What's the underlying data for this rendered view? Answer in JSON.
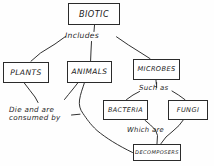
{
  "diagram": {
    "style": "hand-drawn pencil sketch on white paper",
    "ink_color": "#1f1f1f",
    "paper_color": "#fefefe",
    "nodes": [
      {
        "id": "biotic",
        "label": "BIOTIC"
      },
      {
        "id": "plants",
        "label": "PLANTS"
      },
      {
        "id": "animals",
        "label": "ANIMALS"
      },
      {
        "id": "microbes",
        "label": "MICROBES"
      },
      {
        "id": "bacteria",
        "label": "BACTERIA"
      },
      {
        "id": "fungi",
        "label": "FUNGI"
      },
      {
        "id": "decomposers",
        "label": "DECOMPOSERS"
      }
    ],
    "edge_labels": [
      {
        "id": "includes",
        "text": "Includes"
      },
      {
        "id": "such-as",
        "text": "Such as"
      },
      {
        "id": "which-are",
        "text": "Which are"
      },
      {
        "id": "die-consumed",
        "text": "Die and are\nconsumed by"
      }
    ],
    "edges": [
      {
        "from": "biotic",
        "to": "plants",
        "label": "Includes"
      },
      {
        "from": "biotic",
        "to": "animals",
        "label": "Includes"
      },
      {
        "from": "biotic",
        "to": "microbes",
        "label": "Includes"
      },
      {
        "from": "microbes",
        "to": "bacteria",
        "label": "Such as"
      },
      {
        "from": "microbes",
        "to": "fungi",
        "label": "Such as"
      },
      {
        "from": "bacteria",
        "to": "decomposers",
        "label": "Which are"
      },
      {
        "from": "fungi",
        "to": "decomposers",
        "label": "Which are"
      },
      {
        "from": "plants",
        "to": "decomposers",
        "label": "Die and are consumed by"
      },
      {
        "from": "animals",
        "to": "decomposers",
        "label": "Die and are consumed by"
      }
    ]
  }
}
